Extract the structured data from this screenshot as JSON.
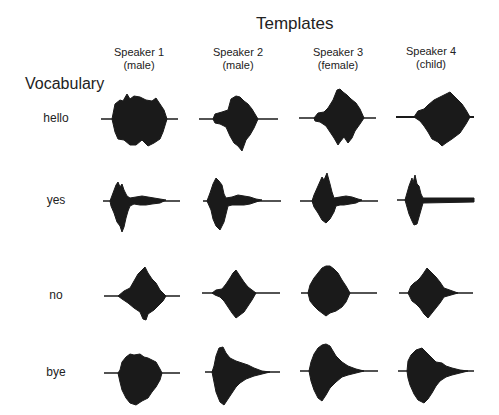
{
  "title": "Templates",
  "row_header": "Vocabulary",
  "speakers": [
    {
      "name": "Speaker 1",
      "type": "(male)"
    },
    {
      "name": "Speaker 2",
      "type": "(male)"
    },
    {
      "name": "Speaker 3",
      "type": "(female)"
    },
    {
      "name": "Speaker 4",
      "type": "(child)"
    }
  ],
  "words": [
    "hello",
    "yes",
    "no",
    "bye"
  ],
  "colors": {
    "waveform": "#1a1a1a",
    "text": "#222222",
    "background": "#ffffff"
  }
}
